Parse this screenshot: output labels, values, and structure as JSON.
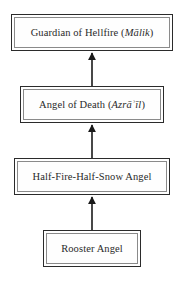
{
  "diagram": {
    "type": "hierarchy-flowchart",
    "orientation": "bottom-to-top",
    "background_color": "#ffffff",
    "box_border_color": "#2b2b2b",
    "box_inner_border_color": "#8a8a8a",
    "text_color": "#2a2a2a",
    "arrow_color": "#1a1a1a",
    "nodes": [
      {
        "id": "guardian",
        "rank": 4,
        "label_plain": "Guardian of Hellfire (Mālik)",
        "title": "Guardian of Hellfire",
        "transliteration": "Mālik",
        "open_paren": "(",
        "close_paren": ")"
      },
      {
        "id": "death",
        "rank": 3,
        "label_plain": "Angel of Death (Azrāʾīl)",
        "title": "Angel of Death",
        "transliteration": "Azrāʾīl",
        "open_paren": "(",
        "close_paren": ")"
      },
      {
        "id": "halffire",
        "rank": 2,
        "label_plain": "Half-Fire-Half-Snow Angel",
        "title": "Half-Fire-Half-Snow Angel",
        "transliteration": "",
        "open_paren": "",
        "close_paren": ""
      },
      {
        "id": "rooster",
        "rank": 1,
        "label_plain": "Rooster Angel",
        "title": "Rooster Angel",
        "transliteration": "",
        "open_paren": "",
        "close_paren": ""
      }
    ],
    "edges": [
      {
        "id": "edge-rooster-to-halffire",
        "from": "rooster",
        "to": "halffire",
        "style": "solid-arrow-up"
      },
      {
        "id": "edge-halffire-to-death",
        "from": "halffire",
        "to": "death",
        "style": "solid-arrow-up"
      },
      {
        "id": "edge-death-to-guardian",
        "from": "death",
        "to": "guardian",
        "style": "solid-arrow-up"
      }
    ]
  }
}
